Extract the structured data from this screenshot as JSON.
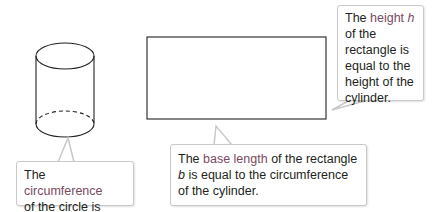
{
  "colors": {
    "stroke": "#231f20",
    "highlight_text": "#7a4a62",
    "callout_border": "#c9c9c9"
  },
  "figures": {
    "cylinder": {
      "label": "cylinder",
      "top_ellipse_dashed": false,
      "bottom_back_edge_dashed": true
    },
    "rectangle": {
      "label": "rectangle"
    }
  },
  "callouts": {
    "left": {
      "prefix": "The ",
      "highlight": "circumference",
      "line2_prefix": "of the circle is ",
      "formula": "2πr",
      "suffix": "."
    },
    "bottom": {
      "prefix": "The ",
      "highlight": "base length",
      "middle": " of the rectangle ",
      "variable": "b",
      "suffix": " is equal to the circumference of the cylinder."
    },
    "right": {
      "prefix": "The ",
      "highlight": "height",
      "variable": " h",
      "suffix": " of the rectangle is equal to the height of the cylinder."
    }
  }
}
